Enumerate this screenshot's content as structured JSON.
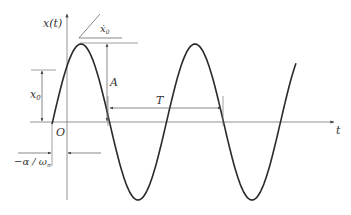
{
  "diagram": {
    "labels": {
      "y_axis": "x(t)",
      "x_axis": "t",
      "origin": "O",
      "initial_displacement": "x",
      "initial_displacement_sub": "0",
      "initial_velocity": "ẋ",
      "initial_velocity_sub": "0",
      "amplitude": "A",
      "period": "T",
      "phase_shift": "−α / ω",
      "phase_shift_sub": "n"
    },
    "colors": {
      "curve": "#2a2a2a",
      "axes": "#666666",
      "annotations": "#555555"
    },
    "curve": {
      "type": "sinusoid",
      "amplitude_px": 78,
      "period_px": 114,
      "start_x_px": 52,
      "end_x_px": 296
    }
  }
}
